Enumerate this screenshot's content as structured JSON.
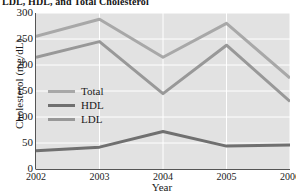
{
  "chart_data": {
    "type": "line",
    "title": "LDL, HDL, and Total Cholesterol",
    "xlabel": "Year",
    "ylabel": "Cholesterol (mg/dL)",
    "x": [
      2002,
      2003,
      2004,
      2005,
      2006
    ],
    "xticklabels": [
      "2002",
      "2003",
      "2004",
      "2005",
      "2006"
    ],
    "yticklabels": [
      "0",
      "50",
      "100",
      "150",
      "200",
      "250",
      "300"
    ],
    "yticks": [
      0,
      50,
      100,
      150,
      200,
      250,
      300
    ],
    "ylim": [
      0,
      300
    ],
    "xlim": [
      2002,
      2006
    ],
    "grid": true,
    "legend_position": "center-left",
    "plot_background": "#e2e2e2",
    "gridline_color": "#ffffff",
    "series": [
      {
        "name": "Total",
        "color": "#a8a8a8",
        "values": [
          255,
          288,
          215,
          280,
          175
        ]
      },
      {
        "name": "HDL",
        "color": "#707070",
        "values": [
          35,
          42,
          72,
          44,
          46
        ]
      },
      {
        "name": "LDL",
        "color": "#989898",
        "values": [
          215,
          245,
          145,
          238,
          130
        ]
      }
    ]
  },
  "legend": {
    "items": [
      {
        "label": "Total",
        "color": "#a8a8a8"
      },
      {
        "label": "HDL",
        "color": "#707070"
      },
      {
        "label": "LDL",
        "color": "#989898"
      }
    ]
  }
}
